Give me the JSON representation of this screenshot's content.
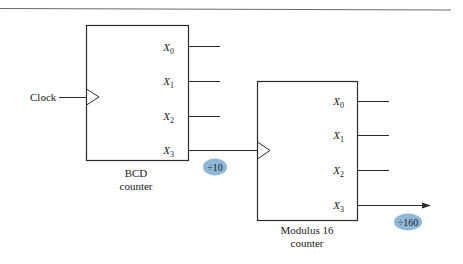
{
  "diagram": {
    "clock_label": "Clock",
    "bcd_counter": {
      "title_line1": "BCD",
      "title_line2": "counter",
      "outputs": [
        {
          "base": "X",
          "sub": "0"
        },
        {
          "base": "X",
          "sub": "1"
        },
        {
          "base": "X",
          "sub": "2"
        },
        {
          "base": "X",
          "sub": "3"
        }
      ],
      "divide_badge": "÷10"
    },
    "mod16_counter": {
      "title_line1": "Modulus 16",
      "title_line2": "counter",
      "outputs": [
        {
          "base": "X",
          "sub": "0"
        },
        {
          "base": "X",
          "sub": "1"
        },
        {
          "base": "X",
          "sub": "2"
        },
        {
          "base": "X",
          "sub": "3"
        }
      ],
      "divide_badge": "÷160"
    },
    "colors": {
      "line": "#2a2a2a",
      "badge_fill": "#8fb8d6",
      "rule": "#6a6a6a"
    }
  }
}
